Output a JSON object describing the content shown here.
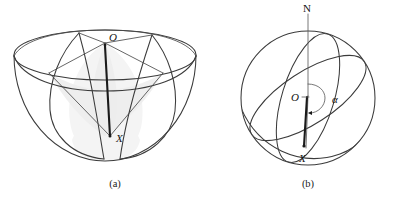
{
  "figure": {
    "type": "geometry-diagram",
    "background_color": "#ffffff",
    "line_color": "#3b3b3b",
    "shade_color": "#ececec",
    "panels": [
      {
        "id": "a",
        "caption": "(a)",
        "shape": "hemispherical-bowl",
        "description": "Hemisphere bowl seen obliquely from above with rim ellipse, inner ellipse and two intersecting lune arcs meeting at O and X, enclosing a shaded spherical region",
        "labels": [
          {
            "name": "O",
            "text": "O",
            "style": "italic",
            "role": "pole-point-top"
          },
          {
            "name": "X",
            "text": "X",
            "style": "italic",
            "role": "point-on-surface"
          }
        ]
      },
      {
        "id": "b",
        "caption": "(b)",
        "shape": "sphere",
        "description": "Sphere with polar axis from N through centre O to point X, two great circle ellipses crossing at X, and a reflex angle alpha marked at the centre between the axis and the radius OX",
        "labels": [
          {
            "name": "N",
            "text": "N",
            "style": "upright",
            "role": "north-pole"
          },
          {
            "name": "O",
            "text": "O",
            "style": "italic",
            "role": "centre"
          },
          {
            "name": "X",
            "text": "X",
            "style": "italic",
            "role": "point-on-surface"
          },
          {
            "name": "alpha",
            "text": "α",
            "style": "italic",
            "role": "angle-label"
          }
        ]
      }
    ]
  },
  "captions": {
    "panel_a": "(a)",
    "panel_b": "(b)"
  },
  "labels_a": {
    "O": "O",
    "X": "X"
  },
  "labels_b": {
    "N": "N",
    "O": "O",
    "X": "X",
    "alpha": "α"
  }
}
